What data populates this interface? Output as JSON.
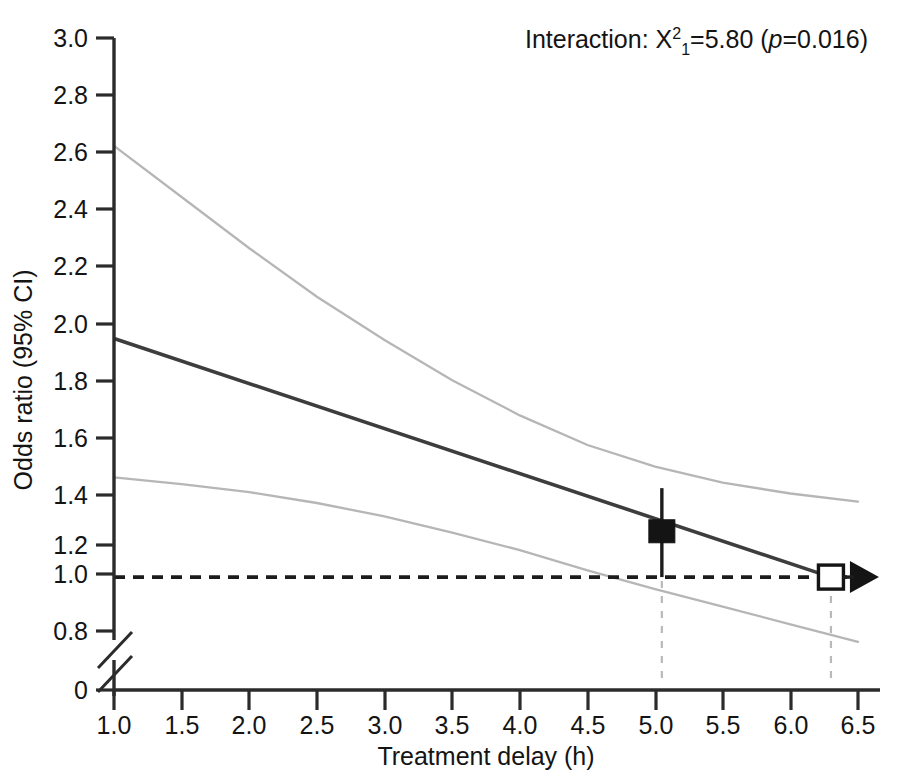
{
  "chart_data": {
    "type": "line",
    "title": "",
    "xlabel": "Treatment delay (h)",
    "ylabel": "Odds ratio (95% CI)",
    "xlim": [
      1.0,
      6.5
    ],
    "ylim": [
      0.8,
      3.0
    ],
    "y_axis_break": true,
    "y_break_from": 0,
    "y_break_to": 0.8,
    "grid": false,
    "legend": "none",
    "xticks": [
      "1.0",
      "1.5",
      "2.0",
      "2.5",
      "3.0",
      "3.5",
      "4.0",
      "4.5",
      "5.0",
      "5.5",
      "6.0",
      "6.5"
    ],
    "xtick_values": [
      1.0,
      1.5,
      2.0,
      2.5,
      3.0,
      3.5,
      4.0,
      4.5,
      5.0,
      5.5,
      6.0,
      6.5
    ],
    "yticks": [
      "3.0",
      "2.8",
      "2.6",
      "2.4",
      "2.2",
      "2.0",
      "1.8",
      "1.6",
      "1.4",
      "1.2",
      "1.0",
      "0.8",
      "0"
    ],
    "ytick_values": [
      3.0,
      2.8,
      2.6,
      2.4,
      2.2,
      2.0,
      1.8,
      1.6,
      1.4,
      1.2,
      1.0,
      0.8,
      0
    ],
    "reference_line": {
      "name": "null-effect-line",
      "y": 1.0,
      "style": "dashed",
      "color": "#1c1c1c"
    },
    "series": [
      {
        "name": "Odds ratio (point estimate)",
        "style": "solid",
        "color": "#3d3d3d",
        "x": [
          1.0,
          1.5,
          2.0,
          2.5,
          3.0,
          3.5,
          4.0,
          4.5,
          5.0,
          5.5,
          6.0,
          6.3
        ],
        "values": [
          1.885,
          1.802,
          1.718,
          1.635,
          1.551,
          1.468,
          1.384,
          1.301,
          1.217,
          1.134,
          1.05,
          1.0
        ]
      },
      {
        "name": "Upper 95% confidence limit",
        "style": "solid",
        "color": "#b6b6b6",
        "x": [
          1.0,
          1.5,
          2.0,
          2.5,
          3.0,
          3.5,
          4.0,
          4.5,
          5.0,
          5.5,
          6.0,
          6.5
        ],
        "values": [
          2.6,
          2.41,
          2.22,
          2.04,
          1.88,
          1.73,
          1.6,
          1.49,
          1.41,
          1.35,
          1.31,
          1.28
        ]
      },
      {
        "name": "Lower 95% confidence limit",
        "style": "solid",
        "color": "#b6b6b6",
        "x": [
          1.0,
          1.5,
          2.0,
          2.5,
          3.0,
          3.5,
          4.0,
          4.5,
          5.0,
          5.5,
          6.0,
          6.5
        ],
        "values": [
          1.37,
          1.345,
          1.315,
          1.275,
          1.225,
          1.165,
          1.1,
          1.025,
          0.955,
          0.89,
          0.825,
          0.76
        ]
      }
    ],
    "markers": [
      {
        "name": "observed-odds-ratio",
        "shape": "filled-square",
        "x": 5.05,
        "y": 1.17,
        "error_low": 1.0,
        "error_high": 1.33
      },
      {
        "name": "crossover-point",
        "shape": "open-square",
        "x": 6.3,
        "y": 1.0,
        "arrow": "right"
      }
    ],
    "drop_lines": [
      {
        "name": "drop-line-observed",
        "x": 5.05,
        "from_y": 1.0,
        "to_y": 0
      },
      {
        "name": "drop-line-crossover",
        "x": 6.3,
        "from_y": 1.0,
        "to_y": 0
      }
    ],
    "annotations": [
      {
        "name": "interaction-statistic",
        "x": 6.5,
        "y": 3.0,
        "text_parts": {
          "prefix": "Interaction: X",
          "superscript": "2",
          "subscript": "1",
          "equals": "=5.80 (",
          "p_italic": "p",
          "p_value": "=0.016)"
        },
        "full_text": "Interaction: X21=5.80 (p=0.016)"
      }
    ]
  }
}
